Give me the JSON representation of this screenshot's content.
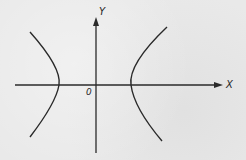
{
  "diagram": {
    "type": "hyperbola",
    "labels": {
      "x_axis": "X",
      "y_axis": "Y",
      "origin": "0"
    },
    "colors": {
      "background": "#e9e9e9",
      "stroke": "#2a2a2a"
    }
  }
}
